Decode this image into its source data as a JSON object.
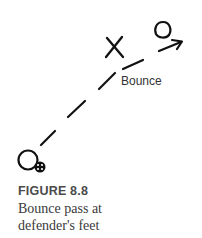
{
  "diagram": {
    "label": "Bounce",
    "stroke_color": "#111111",
    "elements": {
      "receiver": "circle",
      "defender": "X",
      "passer": "circle",
      "ball": "ball",
      "pass_path": "dashed-line",
      "movement": "arrow"
    }
  },
  "figure": {
    "title": "FIGURE 8.8",
    "caption_lines": [
      "Bounce pass at",
      "defender's feet"
    ]
  }
}
